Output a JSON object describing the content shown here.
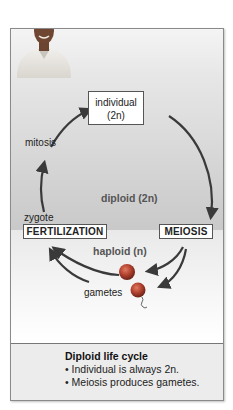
{
  "figure": {
    "colors": {
      "frame_border": "#8a8a8a",
      "diploid_band_top": "#f4f4f4",
      "diploid_band_bottom": "#c9c9c9",
      "haploid_band": "#f7f7f7",
      "caption_bg": "#ececec",
      "arrow": "#3a3a3a",
      "gamete": "#b0402e"
    },
    "portrait": {
      "description": "man-portrait"
    },
    "nodes": {
      "individual_line1": "individual",
      "individual_line2": "(2n)",
      "fertilization": "FERTILIZATION",
      "meiosis": "MEIOSIS"
    },
    "labels": {
      "mitosis": "mitosis",
      "zygote": "zygote",
      "gametes": "gametes"
    },
    "zones": {
      "diploid": "diploid (2n)",
      "haploid": "haploid (n)"
    },
    "caption": {
      "title": "Diploid life cycle",
      "items": [
        "• Individual is always 2n.",
        "• Meiosis produces gametes."
      ]
    }
  }
}
